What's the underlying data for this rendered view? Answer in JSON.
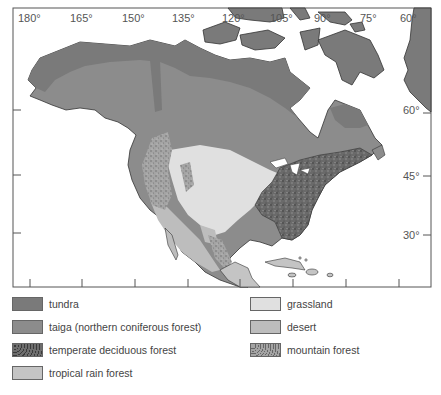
{
  "map": {
    "region": "North America",
    "longitude_labels": [
      "180°",
      "165°",
      "150°",
      "135°",
      "120°",
      "105°",
      "90°",
      "75°",
      "60°"
    ],
    "latitude_labels": [
      "60°",
      "45°",
      "30°"
    ]
  },
  "colors": {
    "tundra": "#7a7a7a",
    "taiga": "#8c8c8c",
    "temperate_deciduous_forest": "#6e6e6e",
    "tropical_rain_forest": "#c4c4c4",
    "grassland": "#e0e0e0",
    "desert": "#bdbdbd",
    "mountain_forest": "#9a9a9a",
    "water": "#ffffff",
    "frame": "#555555"
  },
  "legend": {
    "items": [
      {
        "label": "tundra",
        "key": "tundra"
      },
      {
        "label": "taiga (northern coniferous forest)",
        "key": "taiga"
      },
      {
        "label": "temperate deciduous forest",
        "key": "temperate_deciduous_forest"
      },
      {
        "label": "tropical rain forest",
        "key": "tropical_rain_forest"
      },
      {
        "label": "grassland",
        "key": "grassland"
      },
      {
        "label": "desert",
        "key": "desert"
      },
      {
        "label": "mountain forest",
        "key": "mountain_forest"
      }
    ]
  }
}
